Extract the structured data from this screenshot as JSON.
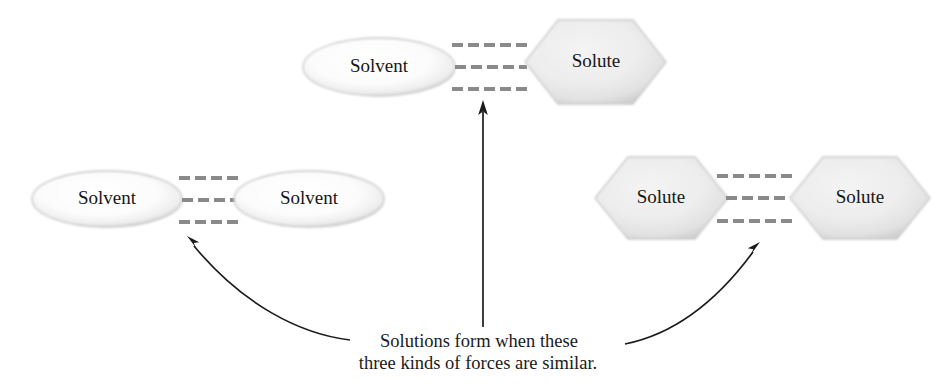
{
  "figure": {
    "background_color": "#ffffff",
    "caption": {
      "line1": "Solutions form when these",
      "line2": "three kinds of forces are similar."
    }
  },
  "colors": {
    "shape_fill_light": "#f6f6f6",
    "shape_fill_gray": "#e6e6e6",
    "shape_edge": "#b8b8b8",
    "bond_dash": "#8a8a8a",
    "pointer": "#1c1c1c",
    "label_text": "#161616"
  },
  "groups": [
    {
      "id": "solvent-solute",
      "name": "solvent-solute-interaction",
      "position": "top-center",
      "left_node": {
        "shape": "ellipse",
        "label": "Solvent"
      },
      "right_node": {
        "shape": "hexagon",
        "label": "Solute"
      },
      "bond_count": 3,
      "pointer": {
        "kind": "straight-vertical-arrow"
      }
    },
    {
      "id": "solvent-solvent",
      "name": "solvent-solvent-interaction",
      "position": "left",
      "left_node": {
        "shape": "ellipse",
        "label": "Solvent"
      },
      "right_node": {
        "shape": "ellipse",
        "label": "Solvent"
      },
      "bond_count": 3,
      "pointer": {
        "kind": "curved-arrow"
      }
    },
    {
      "id": "solute-solute",
      "name": "solute-solute-interaction",
      "position": "right",
      "left_node": {
        "shape": "hexagon",
        "label": "Solute"
      },
      "right_node": {
        "shape": "hexagon",
        "label": "Solute"
      },
      "bond_count": 3,
      "pointer": {
        "kind": "curved-arrow"
      }
    }
  ],
  "labels": {
    "top_solvent": "Solvent",
    "top_solute": "Solute",
    "left_solvent_a": "Solvent",
    "left_solvent_b": "Solvent",
    "right_solute_a": "Solute",
    "right_solute_b": "Solute"
  }
}
